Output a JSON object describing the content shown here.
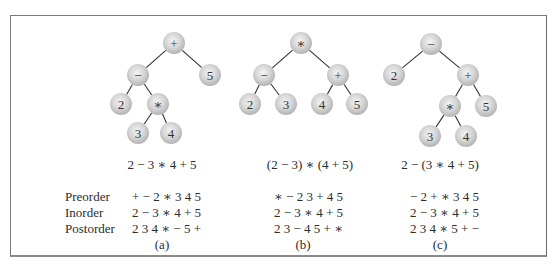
{
  "figure": {
    "row_labels": [
      "Preorder",
      "Inorder",
      "Postorder"
    ],
    "panels": [
      {
        "id": "a",
        "caption": "(a)",
        "expression": "2 − 3 ∗ 4 + 5",
        "preorder": "+ − 2 ∗ 3 4 5",
        "inorder": "2 − 3 ∗ 4 + 5",
        "postorder": "2 3 4 ∗ − 5 +",
        "nodes": [
          {
            "label": "+",
            "x": 174,
            "y": 43
          },
          {
            "label": "−",
            "x": 138,
            "y": 75
          },
          {
            "label": "5",
            "x": 210,
            "y": 75
          },
          {
            "label": "2",
            "x": 121,
            "y": 104
          },
          {
            "label": "∗",
            "x": 158,
            "y": 104
          },
          {
            "label": "3",
            "x": 138,
            "y": 133
          },
          {
            "label": "4",
            "x": 171,
            "y": 133
          }
        ],
        "edges": [
          [
            0,
            1
          ],
          [
            0,
            2
          ],
          [
            1,
            3
          ],
          [
            1,
            4
          ],
          [
            4,
            5
          ],
          [
            4,
            6
          ]
        ]
      },
      {
        "id": "b",
        "caption": "(b)",
        "expression": "(2 − 3) ∗ (4 + 5)",
        "preorder": "∗ − 2 3 + 4 5",
        "inorder": "2 − 3 ∗ 4 + 5",
        "postorder": "2 3 − 4 5 + ∗",
        "nodes": [
          {
            "label": "∗",
            "x": 301,
            "y": 43
          },
          {
            "label": "−",
            "x": 264,
            "y": 75
          },
          {
            "label": "+",
            "x": 338,
            "y": 75
          },
          {
            "label": "2",
            "x": 250,
            "y": 104
          },
          {
            "label": "3",
            "x": 286,
            "y": 104
          },
          {
            "label": "4",
            "x": 322,
            "y": 104
          },
          {
            "label": "5",
            "x": 357,
            "y": 104
          }
        ],
        "edges": [
          [
            0,
            1
          ],
          [
            0,
            2
          ],
          [
            1,
            3
          ],
          [
            1,
            4
          ],
          [
            2,
            5
          ],
          [
            2,
            6
          ]
        ]
      },
      {
        "id": "c",
        "caption": "(c)",
        "expression": "2 − (3 ∗ 4 + 5)",
        "preorder": "− 2 + ∗ 3 4 5",
        "inorder": "2 − 3 ∗ 4 + 5",
        "postorder": "2 3 4 ∗ 5 + −",
        "nodes": [
          {
            "label": "−",
            "x": 431,
            "y": 44
          },
          {
            "label": "2",
            "x": 394,
            "y": 75
          },
          {
            "label": "+",
            "x": 468,
            "y": 75
          },
          {
            "label": "∗",
            "x": 450,
            "y": 106
          },
          {
            "label": "5",
            "x": 486,
            "y": 106
          },
          {
            "label": "3",
            "x": 430,
            "y": 136
          },
          {
            "label": "4",
            "x": 466,
            "y": 136
          }
        ],
        "edges": [
          [
            0,
            1
          ],
          [
            0,
            2
          ],
          [
            2,
            3
          ],
          [
            2,
            4
          ],
          [
            3,
            5
          ],
          [
            3,
            6
          ]
        ]
      }
    ],
    "style": {
      "node_radius": 11,
      "node_fill_center": "#f2f2f2",
      "node_fill_edge": "#b9b9b9",
      "edge_color": "#333333",
      "frame_color": "#7a7a7a"
    }
  }
}
